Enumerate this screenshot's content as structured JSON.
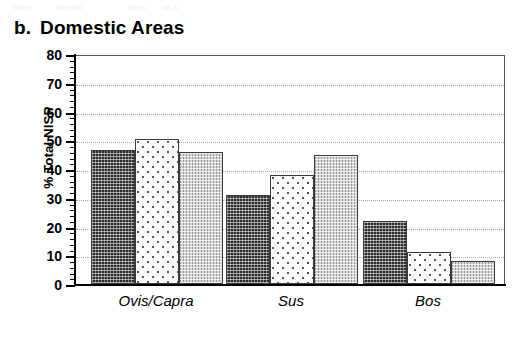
{
  "figure": {
    "panel_letter": "b.",
    "panel_title": "Domestic Areas",
    "top_remnant": [
      "nnnn",
      "nnnnnn",
      "nnnn",
      "nn n"
    ]
  },
  "chart_data": {
    "type": "bar",
    "xlabel": "",
    "ylabel": "% Total NISP",
    "categories": [
      "Ovis/Capra",
      "Sus",
      "Bos"
    ],
    "series": [
      {
        "name": "series-1",
        "pattern": "dark-crosshatch",
        "values": [
          46.5,
          31.0,
          22.0
        ]
      },
      {
        "name": "series-2",
        "pattern": "white-dotted",
        "values": [
          50.5,
          38.0,
          11.0
        ]
      },
      {
        "name": "series-3",
        "pattern": "grey-stipple",
        "values": [
          46.0,
          45.0,
          8.0
        ]
      }
    ],
    "ylim": [
      0,
      80
    ],
    "ytick_labels": [
      "0",
      "10",
      "20",
      "30",
      "40",
      "50",
      "60",
      "70",
      "80"
    ],
    "ytick_values": [
      0,
      10,
      20,
      30,
      40,
      50,
      60,
      70,
      80
    ],
    "ytick_minor_step": 2,
    "grid": "horizontal-dotted",
    "legend": "none",
    "colors": {
      "series_1": "#2e2e30",
      "series_2": "#fdfdfd",
      "series_3": "#d5d5d7",
      "axis": "#000000",
      "gridline": "#a9a9ad",
      "frame": "#55565a",
      "background": "#ffffff"
    }
  }
}
